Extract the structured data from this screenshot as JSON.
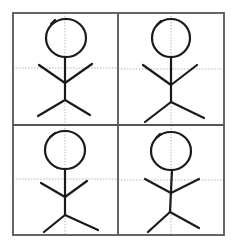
{
  "diagram": {
    "title": "",
    "background": "#ffffff",
    "frame": {
      "x": 13,
      "y": 13,
      "width": 211,
      "height": 222,
      "color": "#555555",
      "stroke_width": 1.8
    },
    "dividers": {
      "vertical_x": 118,
      "horizontal_y": 125,
      "color": "#555555",
      "stroke_width": 1.8
    },
    "guides": {
      "color": "#b5b5b5",
      "stroke_width": 1,
      "dash": "1.5 1.5"
    },
    "figure_style": {
      "color": "#1a1a1a",
      "stroke_width": 2.2
    },
    "cells": [
      {
        "id": "cell-top-left",
        "x": 13,
        "y": 13,
        "width": 105,
        "height": 112,
        "guide_x": 52,
        "guide_y": 55,
        "figure": {
          "head": {
            "cx": 53,
            "cy": 25,
            "rx": 20,
            "ry": 19
          },
          "head_hook": {
            "x1": 38,
            "y1": 11,
            "x2": 42,
            "y2": 7
          },
          "body": {
            "x1": 52,
            "y1": 44,
            "x2": 52,
            "y2": 87
          },
          "arm_left": {
            "x1": 26,
            "y1": 52,
            "x2": 52,
            "y2": 70
          },
          "arm_right": {
            "x1": 79,
            "y1": 51,
            "x2": 52,
            "y2": 70
          },
          "leg_left": {
            "x1": 52,
            "y1": 87,
            "x2": 25,
            "y2": 103
          },
          "leg_right": {
            "x1": 52,
            "y1": 87,
            "x2": 77,
            "y2": 102
          }
        }
      },
      {
        "id": "cell-top-right",
        "x": 118,
        "y": 13,
        "width": 106,
        "height": 112,
        "guide_x": 53,
        "guide_y": 56,
        "figure": {
          "head": {
            "cx": 53,
            "cy": 25,
            "rx": 19,
            "ry": 19
          },
          "head_hook": {
            "x1": 39,
            "y1": 12,
            "x2": 43,
            "y2": 8
          },
          "body": {
            "x1": 53,
            "y1": 44,
            "x2": 53,
            "y2": 89
          },
          "arm_left": {
            "x1": 25,
            "y1": 52,
            "x2": 53,
            "y2": 72
          },
          "arm_right": {
            "x1": 79,
            "y1": 52,
            "x2": 53,
            "y2": 72
          },
          "leg_left": {
            "x1": 53,
            "y1": 89,
            "x2": 27,
            "y2": 109
          },
          "leg_right": {
            "x1": 53,
            "y1": 89,
            "x2": 86,
            "y2": 105
          }
        }
      },
      {
        "id": "cell-bottom-left",
        "x": 13,
        "y": 125,
        "width": 105,
        "height": 110,
        "guide_x": 52,
        "guide_y": 54,
        "figure": {
          "head": {
            "cx": 52,
            "cy": 25,
            "rx": 20,
            "ry": 19
          },
          "head_hook": {
            "x1": 37,
            "y1": 12,
            "x2": 42,
            "y2": 8
          },
          "body": {
            "x1": 52,
            "y1": 44,
            "x2": 52,
            "y2": 90
          },
          "arm_left": {
            "x1": 28,
            "y1": 58,
            "x2": 52,
            "y2": 72
          },
          "arm_right": {
            "x1": 74,
            "y1": 56,
            "x2": 52,
            "y2": 72
          },
          "leg_left": {
            "x1": 52,
            "y1": 90,
            "x2": 31,
            "y2": 107
          },
          "leg_right": {
            "x1": 52,
            "y1": 90,
            "x2": 85,
            "y2": 105
          }
        }
      },
      {
        "id": "cell-bottom-right",
        "x": 118,
        "y": 125,
        "width": 106,
        "height": 110,
        "guide_x": 53,
        "guide_y": 55,
        "figure": {
          "head": {
            "cx": 53,
            "cy": 26,
            "rx": 20,
            "ry": 19
          },
          "head_hook": {
            "x1": 38,
            "y1": 13,
            "x2": 42,
            "y2": 9
          },
          "body": {
            "x1": 54,
            "y1": 45,
            "x2": 52,
            "y2": 87
          },
          "arm_left": {
            "x1": 27,
            "y1": 54,
            "x2": 53,
            "y2": 68
          },
          "arm_right": {
            "x1": 81,
            "y1": 54,
            "x2": 53,
            "y2": 68
          },
          "leg_left": {
            "x1": 52,
            "y1": 87,
            "x2": 30,
            "y2": 107
          },
          "leg_right": {
            "x1": 52,
            "y1": 87,
            "x2": 81,
            "y2": 103
          }
        }
      }
    ]
  }
}
